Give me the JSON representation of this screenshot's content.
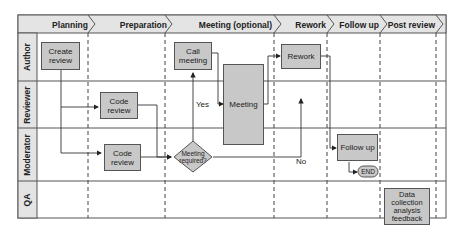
{
  "phases": [
    "Planning",
    "Preparation",
    "Meeting (optional)",
    "Rework",
    "Follow up",
    "Post review"
  ],
  "lanes": [
    "Author",
    "Reviewer",
    "Moderator",
    "QA"
  ],
  "nodes": {
    "create_review": "Create review",
    "code_review_reviewer": "Code review",
    "code_review_moderator": "Code review",
    "call_meeting": "Call meeting",
    "meeting": "Meeting",
    "decision": "Meeting required?",
    "rework": "Rework",
    "follow_up": "Follow up",
    "end": "END",
    "qa_box": "Data collection analysis feedback"
  },
  "edge_labels": {
    "yes": "Yes",
    "no": "No"
  },
  "colors": {
    "box_fill": "#c8c8c8",
    "header_fill": "#e4e4e4",
    "border": "#555555"
  }
}
